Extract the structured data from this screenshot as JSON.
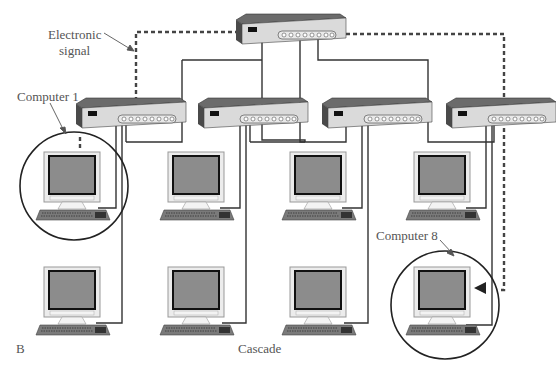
{
  "diagram": {
    "title": "Cascade",
    "panel_label": "B",
    "labels": {
      "signal_line1": "Electronic",
      "signal_line2": "signal",
      "computer_first": "Computer 1",
      "computer_last": "Computer 8"
    },
    "topology": "cascade",
    "nodes": {
      "top_hub": {
        "type": "hub",
        "x": 238,
        "y": 20
      },
      "hubs": [
        {
          "id": "hub-1",
          "x": 78,
          "y": 100
        },
        {
          "id": "hub-2",
          "x": 200,
          "y": 100
        },
        {
          "id": "hub-3",
          "x": 323,
          "y": 100
        },
        {
          "id": "hub-4",
          "x": 448,
          "y": 100
        }
      ],
      "computers": [
        {
          "id": "computer-1",
          "x": 40,
          "y": 152,
          "highlighted": true
        },
        {
          "id": "computer-2",
          "x": 163,
          "y": 152
        },
        {
          "id": "computer-3",
          "x": 285,
          "y": 152
        },
        {
          "id": "computer-4",
          "x": 410,
          "y": 152
        },
        {
          "id": "computer-5",
          "x": 40,
          "y": 267
        },
        {
          "id": "computer-6",
          "x": 163,
          "y": 267
        },
        {
          "id": "computer-7",
          "x": 285,
          "y": 267
        },
        {
          "id": "computer-8",
          "x": 410,
          "y": 267,
          "highlighted": true
        }
      ]
    },
    "colors": {
      "hub_top": "#6b6b6b",
      "hub_front": "#d9d9d9",
      "hub_side": "#4a4a4a",
      "screen": "#8c8c8c",
      "monitor_frame": "#e6e6e6",
      "cable": "#333333",
      "signal": "#444444",
      "label": "#555555"
    }
  }
}
